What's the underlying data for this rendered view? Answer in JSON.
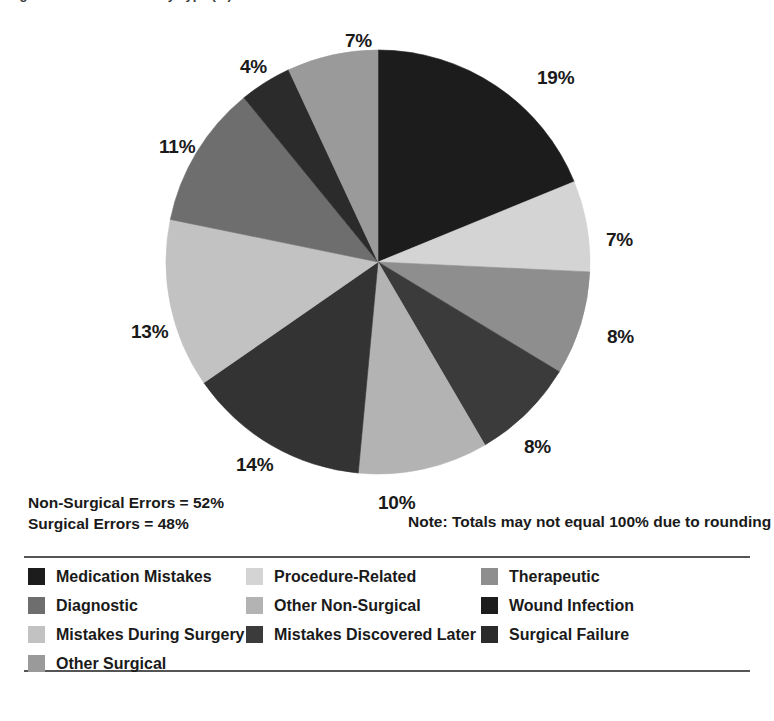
{
  "title": {
    "text": "Figure 1. Medical Errors by Type (%)",
    "cropped": true
  },
  "chart_data": {
    "type": "pie",
    "title": "Medical Errors by Type",
    "xlabel": "",
    "ylabel": "",
    "legend_position": "bottom",
    "grid": false,
    "start_angle_deg": 0,
    "direction": "clockwise",
    "categories": [
      "Medication Mistakes",
      "Procedure-Related",
      "Therapeutic",
      "Wound Infection",
      "Surgical Failure",
      "Mistakes Discovered Later",
      "Mistakes During Surgery",
      "Diagnostic",
      "Other Surgical",
      "Other Non-Surgical"
    ],
    "values": [
      19,
      7,
      8,
      8,
      10,
      14,
      13,
      11,
      4,
      7
    ],
    "value_labels": [
      "19%",
      "7%",
      "8%",
      "8%",
      "10%",
      "14%",
      "13%",
      "11%",
      "4%",
      "7%"
    ],
    "colors": [
      "#1c1c1c",
      "#d4d4d4",
      "#8e8e8e",
      "#3b3b3b",
      "#b3b3b3",
      "#333333",
      "#c2c2c2",
      "#6e6e6e",
      "#2b2b2b",
      "#9a9a9a"
    ],
    "annotations": [
      "Non-Surgical Errors = 52%",
      "Surgical Errors = 48%",
      "Note: Totals may not equal 100% due to rounding"
    ]
  },
  "slice_labels": [
    {
      "text": "19%",
      "left": 537,
      "top": 53
    },
    {
      "text": "7%",
      "left": 606,
      "top": 215
    },
    {
      "text": "8%",
      "left": 607,
      "top": 312
    },
    {
      "text": "8%",
      "left": 524,
      "top": 422
    },
    {
      "text": "10%",
      "left": 378,
      "top": 478
    },
    {
      "text": "14%",
      "left": 236,
      "top": 440
    },
    {
      "text": "13%",
      "left": 131,
      "top": 307
    },
    {
      "text": "11%",
      "left": 159,
      "top": 122
    },
    {
      "text": "4%",
      "left": 240,
      "top": 42
    },
    {
      "text": "7%",
      "left": 345,
      "top": 16
    }
  ],
  "summary": {
    "non_surgical": "Non-Surgical Errors = 52%",
    "surgical": "Surgical Errors = 48%",
    "note": "Note: Totals may not equal 100% due to rounding"
  },
  "legend": {
    "items": [
      {
        "label": "Medication Mistakes",
        "color": "#1c1c1c",
        "col": 0,
        "row": 0
      },
      {
        "label": "Diagnostic",
        "color": "#6e6e6e",
        "col": 0,
        "row": 1
      },
      {
        "label": "Mistakes During Surgery",
        "color": "#c2c2c2",
        "col": 0,
        "row": 2
      },
      {
        "label": "Other Surgical",
        "color": "#9a9a9a",
        "col": 0,
        "row": 3
      },
      {
        "label": "Procedure-Related",
        "color": "#d4d4d4",
        "col": 1,
        "row": 0
      },
      {
        "label": "Other Non-Surgical",
        "color": "#b3b3b3",
        "col": 1,
        "row": 1
      },
      {
        "label": "Mistakes Discovered Later",
        "color": "#3b3b3b",
        "col": 1,
        "row": 2
      },
      {
        "label": "Therapeutic",
        "color": "#8e8e8e",
        "col": 2,
        "row": 0
      },
      {
        "label": "Wound Infection",
        "color": "#1c1c1c",
        "col": 2,
        "row": 1
      },
      {
        "label": "Surgical Failure",
        "color": "#2b2b2b",
        "col": 2,
        "row": 2
      }
    ]
  }
}
